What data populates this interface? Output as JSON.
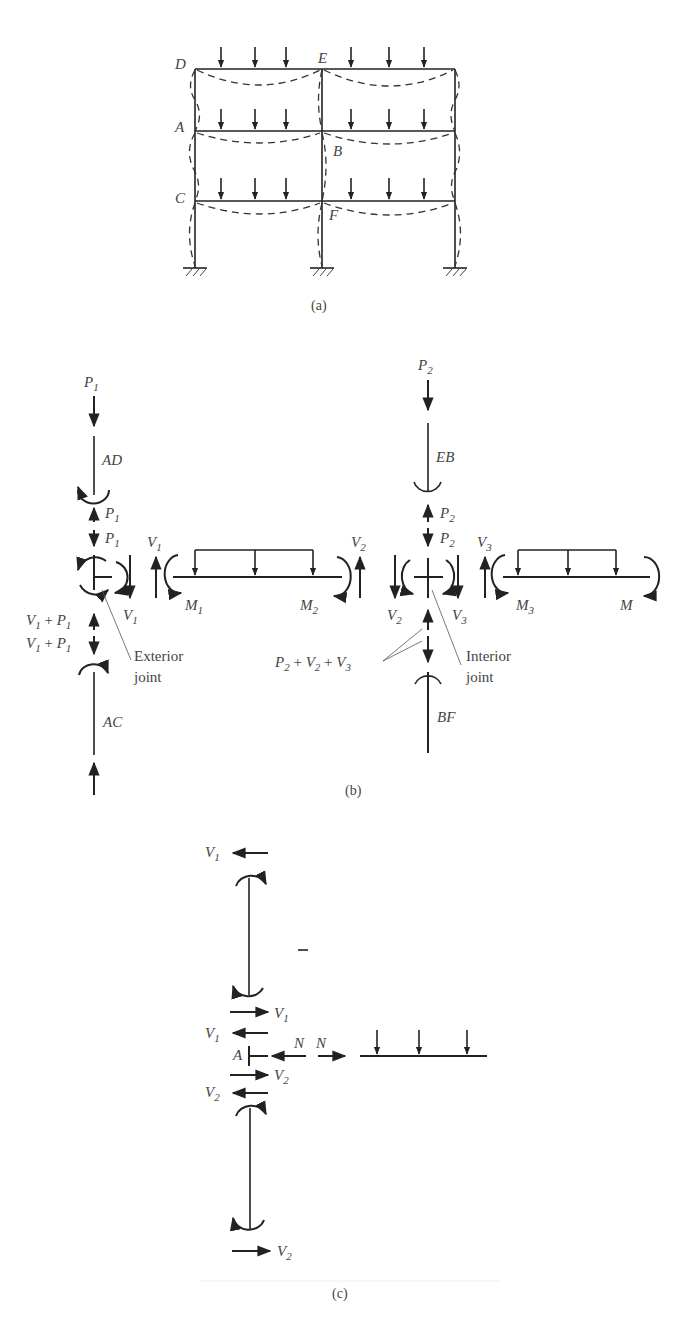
{
  "figure": {
    "panel_a": {
      "caption": "(a)",
      "joint_labels": {
        "D": "D",
        "E": "E",
        "A": "A",
        "B": "B",
        "C": "C",
        "F": "F"
      }
    },
    "panel_b": {
      "caption": "(b)",
      "exterior": {
        "load_top": {
          "main": "P",
          "sub": "1"
        },
        "member_top": "AD",
        "p1_up": {
          "main": "P",
          "sub": "1"
        },
        "p1_down": {
          "main": "P",
          "sub": "1"
        },
        "v1_right": {
          "main": "V",
          "sub": "1"
        },
        "v1_sum_up": {
          "a": "V",
          "as": "1",
          "op": " + ",
          "b": "P",
          "bs": "1"
        },
        "v1_sum_down": {
          "a": "V",
          "as": "1",
          "op": " + ",
          "b": "P",
          "bs": "1"
        },
        "member_bottom": "AC",
        "joint_label_1": "Exterior",
        "joint_label_2": "joint"
      },
      "beam_left": {
        "v_left": {
          "main": "V",
          "sub": "1"
        },
        "v_right": {
          "main": "V",
          "sub": "2"
        },
        "m_left": {
          "main": "M",
          "sub": "1"
        },
        "m_right": {
          "main": "M",
          "sub": "2"
        }
      },
      "interior": {
        "load_top": {
          "main": "P",
          "sub": "2"
        },
        "member_top": "EB",
        "p2_up": {
          "main": "P",
          "sub": "2"
        },
        "p2_down": {
          "main": "P",
          "sub": "2"
        },
        "v2_left": {
          "main": "V",
          "sub": "2"
        },
        "v3_right": {
          "main": "V",
          "sub": "3"
        },
        "sum": {
          "a": "P",
          "as": "2",
          "op1": " + ",
          "b": "V",
          "bs": "2",
          "op2": " + ",
          "c": "V",
          "cs": "3"
        },
        "member_bottom": "BF",
        "joint_label_1": "Interior",
        "joint_label_2": "joint"
      },
      "beam_right": {
        "v_left": {
          "main": "V",
          "sub": "3"
        },
        "m_left": {
          "main": "M",
          "sub": "3"
        },
        "m_right": "M"
      }
    },
    "panel_c": {
      "caption": "(c)",
      "v1_top": {
        "main": "V",
        "sub": "1"
      },
      "v1_mid_right": {
        "main": "V",
        "sub": "1"
      },
      "v1_mid_left": {
        "main": "V",
        "sub": "1"
      },
      "joint": "A",
      "n_left": "N",
      "n_right": "N",
      "v2_mid_right": {
        "main": "V",
        "sub": "2"
      },
      "v2_mid_left": {
        "main": "V",
        "sub": "2"
      },
      "v2_bottom": {
        "main": "V",
        "sub": "2"
      }
    }
  }
}
